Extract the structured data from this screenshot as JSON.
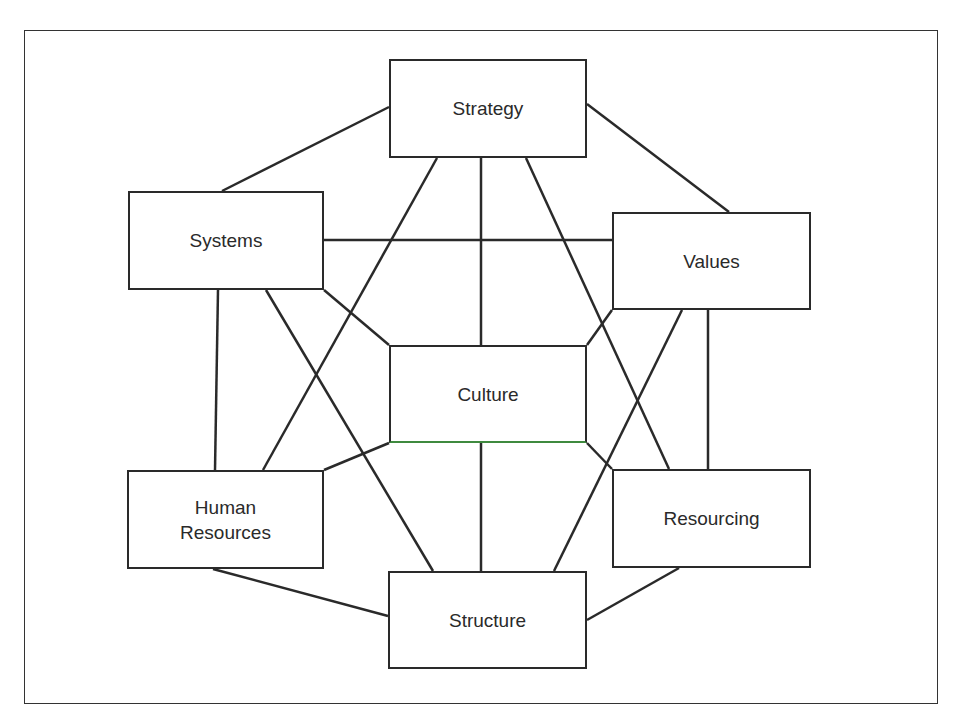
{
  "diagram": {
    "type": "network",
    "nodes": [
      {
        "id": "strategy",
        "label": "Strategy",
        "x": 389,
        "y": 59,
        "w": 198,
        "h": 99
      },
      {
        "id": "systems",
        "label": "Systems",
        "x": 128,
        "y": 191,
        "w": 196,
        "h": 99
      },
      {
        "id": "values",
        "label": "Values",
        "x": 612,
        "y": 212,
        "w": 199,
        "h": 98
      },
      {
        "id": "culture",
        "label": "Culture",
        "x": 389,
        "y": 345,
        "w": 198,
        "h": 98
      },
      {
        "id": "human_resources",
        "label": "Human\nResources",
        "x": 127,
        "y": 470,
        "w": 197,
        "h": 99
      },
      {
        "id": "resourcing",
        "label": "Resourcing",
        "x": 612,
        "y": 469,
        "w": 199,
        "h": 99
      },
      {
        "id": "structure",
        "label": "Structure",
        "x": 388,
        "y": 571,
        "w": 199,
        "h": 98
      }
    ],
    "edges": [
      {
        "from": "strategy",
        "to": "systems",
        "x1": 389,
        "y1": 107,
        "x2": 222,
        "y2": 191
      },
      {
        "from": "strategy",
        "to": "values",
        "x1": 587,
        "y1": 104,
        "x2": 729,
        "y2": 212
      },
      {
        "from": "strategy",
        "to": "human_resources",
        "x1": 437,
        "y1": 158,
        "x2": 263,
        "y2": 470
      },
      {
        "from": "strategy",
        "to": "culture",
        "x1": 481,
        "y1": 158,
        "x2": 481,
        "y2": 345
      },
      {
        "from": "strategy",
        "to": "resourcing",
        "x1": 526,
        "y1": 158,
        "x2": 669,
        "y2": 469
      },
      {
        "from": "systems",
        "to": "values",
        "x1": 324,
        "y1": 240,
        "x2": 612,
        "y2": 240
      },
      {
        "from": "systems",
        "to": "human_resources",
        "x1": 218,
        "y1": 290,
        "x2": 215,
        "y2": 470
      },
      {
        "from": "systems",
        "to": "structure",
        "x1": 266,
        "y1": 290,
        "x2": 433,
        "y2": 571
      },
      {
        "from": "systems",
        "to": "culture",
        "x1": 324,
        "y1": 290,
        "x2": 389,
        "y2": 345
      },
      {
        "from": "values",
        "to": "culture",
        "x1": 612,
        "y1": 310,
        "x2": 587,
        "y2": 345
      },
      {
        "from": "values",
        "to": "structure",
        "x1": 682,
        "y1": 310,
        "x2": 554,
        "y2": 571
      },
      {
        "from": "values",
        "to": "resourcing",
        "x1": 708,
        "y1": 310,
        "x2": 708,
        "y2": 469
      },
      {
        "from": "culture",
        "to": "human_resources",
        "x1": 389,
        "y1": 443,
        "x2": 324,
        "y2": 470
      },
      {
        "from": "culture",
        "to": "resourcing",
        "x1": 587,
        "y1": 443,
        "x2": 612,
        "y2": 469
      },
      {
        "from": "culture",
        "to": "structure",
        "x1": 481,
        "y1": 443,
        "x2": 481,
        "y2": 571
      },
      {
        "from": "human_resources",
        "to": "structure",
        "x1": 213,
        "y1": 569,
        "x2": 388,
        "y2": 616
      },
      {
        "from": "resourcing",
        "to": "structure",
        "x1": 679,
        "y1": 568,
        "x2": 587,
        "y2": 620
      }
    ]
  },
  "colors": {
    "line": "#2a2a2a",
    "frame": "#333333",
    "background": "#ffffff",
    "culture_bottom_edge": "#3f8a3f"
  }
}
